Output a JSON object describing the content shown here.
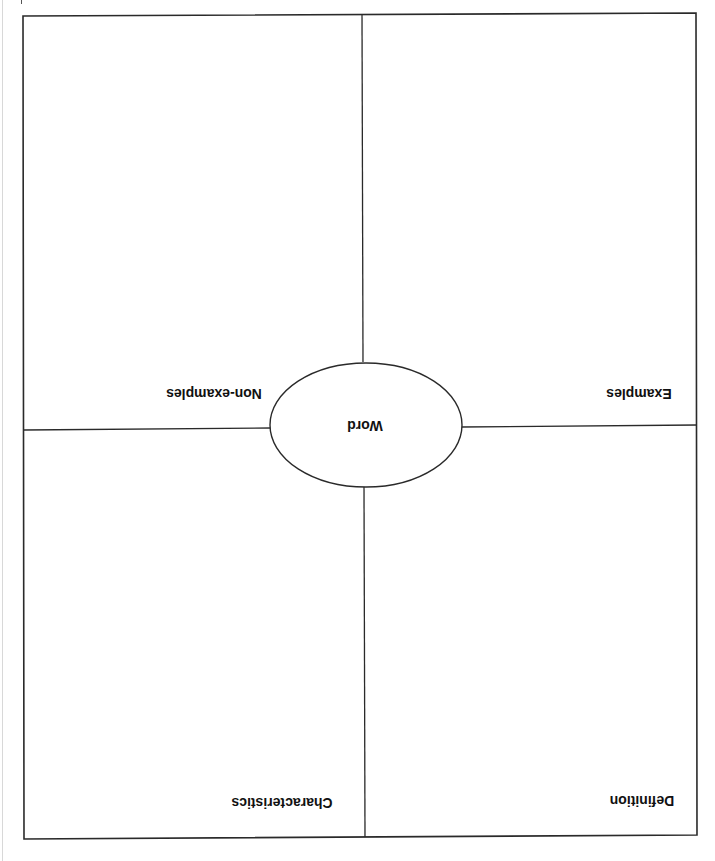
{
  "document": {
    "type": "frayer-model-worksheet",
    "orientation": "rotated-180",
    "center": {
      "label": "Word"
    },
    "quadrants": {
      "top_left": {
        "label": "Non-examples"
      },
      "top_right": {
        "label": "Examples"
      },
      "bottom_left": {
        "label": "Characteristics"
      },
      "bottom_right": {
        "label": "Definition"
      }
    }
  },
  "colors": {
    "line": "#2a2a2a",
    "text": "#111111",
    "background": "#ffffff"
  }
}
